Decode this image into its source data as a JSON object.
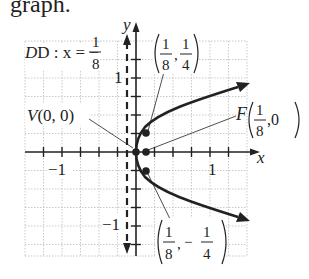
{
  "heading": "graph.",
  "figure": {
    "directrix_label": "D : x = −",
    "directrix_frac": {
      "num": "1",
      "den": "8"
    },
    "vertex_label": "V(0, 0)",
    "focus_label": "F",
    "focus_frac": {
      "num": "1",
      "den": "8",
      "tail": ",0"
    },
    "upper_point": {
      "x_num": "1",
      "x_den": "8",
      "y_num": "1",
      "y_den": "4"
    },
    "lower_point": {
      "x_num": "1",
      "x_den": "8",
      "y_sign": "−",
      "y_num": "1",
      "y_den": "4"
    },
    "x_axis_label": "x",
    "y_axis_label": "y",
    "tick_labels": {
      "x_neg": "−1",
      "x_pos": "1",
      "y_pos": "1",
      "y_neg": "−1"
    },
    "colors": {
      "ink": "#222222",
      "grid": "#bbbbbb"
    }
  }
}
